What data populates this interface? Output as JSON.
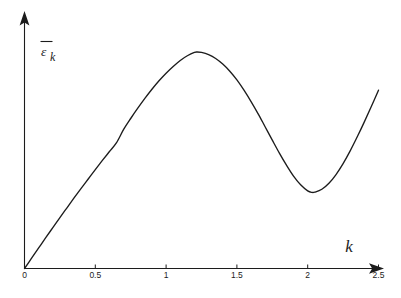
{
  "chart_data": {
    "type": "line",
    "title": "",
    "subtitle": "",
    "xlabel": "k",
    "ylabel": "ε̄_k",
    "ylabel_base": "ε",
    "ylabel_subscript": "k",
    "ylabel_has_overbar": true,
    "xlim": [
      0,
      2.5
    ],
    "ylim": [
      0,
      1.12
    ],
    "grid": false,
    "legend": null,
    "legend_position": "none",
    "xticks": [
      0,
      0.5,
      1,
      1.5,
      2,
      2.5
    ],
    "xtick_labels": [
      "0",
      "0.5",
      "1",
      "1.5",
      "2",
      "2.5"
    ],
    "yticks": [],
    "ytick_labels": [],
    "axis_style": "arrowed-spines",
    "annotations": [],
    "series": [
      {
        "name": "epsilon-bar-k",
        "color": "#1c1c1c",
        "x": [
          0.0,
          0.05,
          0.1,
          0.15,
          0.2,
          0.25,
          0.3,
          0.35,
          0.4,
          0.45,
          0.5,
          0.55,
          0.6,
          0.65,
          0.7,
          0.75,
          0.8,
          0.85,
          0.9,
          0.95,
          1.0,
          1.05,
          1.1,
          1.15,
          1.2,
          1.22,
          1.25,
          1.3,
          1.35,
          1.4,
          1.45,
          1.5,
          1.55,
          1.6,
          1.65,
          1.7,
          1.75,
          1.8,
          1.85,
          1.9,
          1.95,
          2.0,
          2.03,
          2.05,
          2.1,
          2.15,
          2.2,
          2.25,
          2.3,
          2.35,
          2.4,
          2.45,
          2.5
        ],
        "y": [
          0.0,
          0.046,
          0.092,
          0.138,
          0.183,
          0.228,
          0.272,
          0.316,
          0.359,
          0.401,
          0.443,
          0.484,
          0.524,
          0.564,
          0.623,
          0.672,
          0.718,
          0.762,
          0.803,
          0.841,
          0.875,
          0.905,
          0.932,
          0.953,
          0.968,
          0.97,
          0.968,
          0.958,
          0.941,
          0.916,
          0.884,
          0.845,
          0.799,
          0.748,
          0.693,
          0.634,
          0.575,
          0.517,
          0.463,
          0.414,
          0.375,
          0.348,
          0.341,
          0.342,
          0.355,
          0.382,
          0.421,
          0.47,
          0.527,
          0.59,
          0.657,
          0.727,
          0.799
        ]
      }
    ],
    "key_points": {
      "origin": {
        "x": 0,
        "y": 0,
        "label": "origin"
      },
      "maximum": {
        "x": 1.22,
        "y": 0.97,
        "label": "peak"
      },
      "minimum": {
        "x": 2.03,
        "y": 0.34,
        "label": "trough"
      },
      "end": {
        "x": 2.5,
        "y": 0.8,
        "label": "right-end"
      }
    },
    "colors": {
      "curve": "#1c1c1c",
      "axis": "#1c1c1c",
      "background": "#ffffff",
      "text": "#1c1c1c"
    }
  }
}
